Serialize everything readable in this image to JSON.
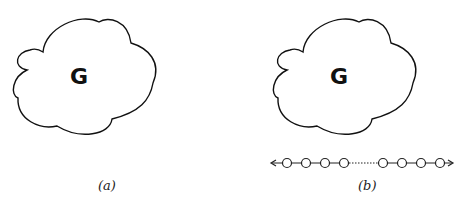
{
  "panels": [
    {
      "caption": "(a)",
      "graph_label": "G"
    },
    {
      "caption": "(b)",
      "graph_label": "G",
      "path": {
        "left_nodes": 4,
        "right_nodes": 4,
        "gap": "dotted",
        "ends": "arrows"
      }
    }
  ]
}
